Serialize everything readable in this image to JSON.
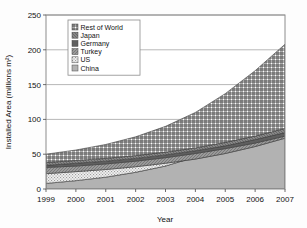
{
  "chart_data": {
    "type": "area",
    "stacked": true,
    "title": "",
    "xlabel": "Year",
    "ylabel": "Installed Area (millions m²)",
    "x": [
      1999,
      2000,
      2001,
      2002,
      2003,
      2004,
      2005,
      2006,
      2007
    ],
    "xtick_labels": [
      "1999",
      "2000",
      "2001",
      "2002",
      "2003",
      "2004",
      "2005",
      "2006",
      "2007"
    ],
    "ytick_labels": [
      "0",
      "50",
      "100",
      "150",
      "200",
      "250"
    ],
    "yticks": [
      0,
      50,
      100,
      150,
      200,
      250
    ],
    "ylim": [
      0,
      250
    ],
    "xlim": [
      1999,
      2007
    ],
    "grid": true,
    "legend_position": "upper-left-inside",
    "stack_order_bottom_to_top": [
      "China",
      "US",
      "Turkey",
      "Germany",
      "Japan",
      "Rest of World"
    ],
    "series": [
      {
        "name": "China",
        "values": [
          8,
          12,
          17,
          24,
          33,
          46,
          63,
          85,
          110
        ],
        "pattern": "solid-gray",
        "color": "#b0b0b0"
      },
      {
        "name": "US",
        "values": [
          22,
          25,
          28,
          32,
          37,
          43,
          51,
          61,
          73
        ],
        "pattern": "fine-dots",
        "color": "#e4e4e4"
      },
      {
        "name": "Turkey",
        "values": [
          31,
          33,
          36,
          40,
          45,
          51,
          58,
          66,
          76
        ],
        "pattern": "mid-gray",
        "color": "#9a9a9a"
      },
      {
        "name": "Germany",
        "values": [
          34,
          37,
          40,
          44,
          49,
          55,
          62,
          71,
          81
        ],
        "pattern": "dark-gray",
        "color": "#6e6e6e"
      },
      {
        "name": "Japan",
        "values": [
          38,
          41,
          44,
          48,
          53,
          59,
          67,
          76,
          87
        ],
        "pattern": "darker-gray",
        "color": "#808080"
      },
      {
        "name": "Rest of World",
        "values": [
          50,
          56,
          64,
          75,
          90,
          110,
          137,
          170,
          208
        ],
        "pattern": "crosshatch",
        "color": "#ffffff"
      }
    ],
    "cumulative_tops": {
      "China": [
        8,
        12,
        17,
        24,
        33,
        46,
        63,
        85,
        110
      ],
      "US": [
        22,
        25,
        28,
        32,
        37,
        43,
        51,
        61,
        73
      ],
      "Turkey": [
        31,
        33,
        36,
        40,
        45,
        51,
        58,
        66,
        76
      ],
      "Germany": [
        34,
        37,
        40,
        44,
        49,
        55,
        62,
        71,
        81
      ],
      "Japan": [
        38,
        41,
        44,
        48,
        53,
        59,
        67,
        76,
        87
      ],
      "Rest of World": [
        50,
        56,
        64,
        75,
        90,
        110,
        137,
        170,
        208
      ]
    },
    "legend_entries": [
      {
        "label": "Rest of World",
        "pattern": "crosshatch"
      },
      {
        "label": "Japan",
        "pattern": "darker-gray"
      },
      {
        "label": "Germany",
        "pattern": "dark-gray"
      },
      {
        "label": "Turkey",
        "pattern": "mid-gray"
      },
      {
        "label": "US",
        "pattern": "fine-dots"
      },
      {
        "label": "China",
        "pattern": "solid-gray"
      }
    ]
  },
  "colors": {
    "frame": "#8c8c8c",
    "grid": "#9a9a9a",
    "text": "#111111",
    "background": "#fdfdfd"
  }
}
